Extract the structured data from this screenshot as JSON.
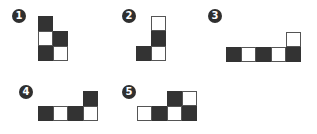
{
  "colors": {
    "dark_cell": "#333333",
    "light_cell": "#ffffff",
    "border": "#555555",
    "badge": "#2f2f2f"
  },
  "cell_size": 15,
  "figures": [
    {
      "label": "1",
      "badge": {
        "x": 12,
        "y": 9
      },
      "origin": {
        "x": 38,
        "y": 16
      },
      "cells": [
        {
          "col": 0,
          "row": 0,
          "fill": "dark"
        },
        {
          "col": 0,
          "row": 1,
          "fill": "light"
        },
        {
          "col": 1,
          "row": 1,
          "fill": "dark"
        },
        {
          "col": 0,
          "row": 2,
          "fill": "dark"
        },
        {
          "col": 1,
          "row": 2,
          "fill": "light"
        }
      ]
    },
    {
      "label": "2",
      "badge": {
        "x": 122,
        "y": 9
      },
      "origin": {
        "x": 136,
        "y": 16
      },
      "cells": [
        {
          "col": 1,
          "row": 0,
          "fill": "light"
        },
        {
          "col": 1,
          "row": 1,
          "fill": "dark"
        },
        {
          "col": 0,
          "row": 2,
          "fill": "dark"
        },
        {
          "col": 1,
          "row": 2,
          "fill": "light"
        }
      ]
    },
    {
      "label": "3",
      "badge": {
        "x": 208,
        "y": 9
      },
      "origin": {
        "x": 226,
        "y": 32
      },
      "cells": [
        {
          "col": 4,
          "row": 0,
          "fill": "light"
        },
        {
          "col": 0,
          "row": 1,
          "fill": "dark"
        },
        {
          "col": 1,
          "row": 1,
          "fill": "light"
        },
        {
          "col": 2,
          "row": 1,
          "fill": "dark"
        },
        {
          "col": 3,
          "row": 1,
          "fill": "light"
        },
        {
          "col": 4,
          "row": 1,
          "fill": "dark"
        }
      ]
    },
    {
      "label": "4",
      "badge": {
        "x": 19,
        "y": 85
      },
      "origin": {
        "x": 38,
        "y": 91
      },
      "cells": [
        {
          "col": 3,
          "row": 0,
          "fill": "dark"
        },
        {
          "col": 0,
          "row": 1,
          "fill": "dark"
        },
        {
          "col": 1,
          "row": 1,
          "fill": "light"
        },
        {
          "col": 2,
          "row": 1,
          "fill": "dark"
        },
        {
          "col": 3,
          "row": 1,
          "fill": "light"
        }
      ]
    },
    {
      "label": "5",
      "badge": {
        "x": 122,
        "y": 85
      },
      "origin": {
        "x": 137,
        "y": 91
      },
      "cells": [
        {
          "col": 2,
          "row": 0,
          "fill": "dark"
        },
        {
          "col": 3,
          "row": 0,
          "fill": "light"
        },
        {
          "col": 0,
          "row": 1,
          "fill": "light"
        },
        {
          "col": 1,
          "row": 1,
          "fill": "dark"
        },
        {
          "col": 2,
          "row": 1,
          "fill": "light"
        },
        {
          "col": 3,
          "row": 1,
          "fill": "dark"
        }
      ]
    }
  ]
}
